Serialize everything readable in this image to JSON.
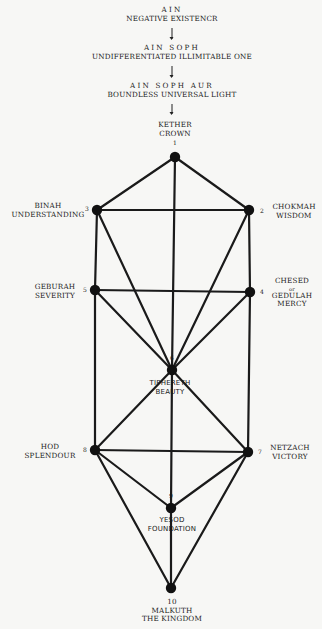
{
  "veils": [
    {
      "title": "AIN",
      "subtitle": "NEGATIVE EXISTENCR"
    },
    {
      "title": "AIN SOPH",
      "subtitle": "UNDIFFERENTIATED ILLIMITABLE ONE"
    },
    {
      "title": "AIN SOPH AUR",
      "subtitle": "BOUNDLESS UNIVERSAL LIGHT"
    }
  ],
  "sephiroth": [
    {
      "number": "1",
      "name": "KETHER",
      "meaning": "CROWN",
      "x": 175,
      "y": 157
    },
    {
      "number": "2",
      "name": "CHOKMAH",
      "meaning": "WISDOM",
      "x": 249,
      "y": 210
    },
    {
      "number": "3",
      "name": "BINAH",
      "meaning": "UNDERSTANDING",
      "x": 97,
      "y": 210
    },
    {
      "number": "4",
      "name": "CHESED",
      "connector": "or",
      "alt_name": "GEDULAH",
      "meaning": "MERCY",
      "x": 250,
      "y": 292
    },
    {
      "number": "5",
      "name": "GEBURAH",
      "meaning": "SEVERITY",
      "x": 95,
      "y": 290
    },
    {
      "number": "6",
      "name": "TIPHERETH",
      "meaning": "BEAUTY",
      "x": 172,
      "y": 370
    },
    {
      "number": "7",
      "name": "NETZACH",
      "meaning": "VICTORY",
      "x": 248,
      "y": 452
    },
    {
      "number": "8",
      "name": "HOD",
      "meaning": "SPLENDOUR",
      "x": 95,
      "y": 450
    },
    {
      "number": "9",
      "name": "YESOD",
      "meaning": "FOUNDATION",
      "x": 171,
      "y": 508
    },
    {
      "number": "10",
      "name": "MALKUTH",
      "meaning": "THE KINGDOM",
      "x": 171,
      "y": 588
    }
  ],
  "paths": [
    [
      1,
      2
    ],
    [
      1,
      3
    ],
    [
      1,
      6
    ],
    [
      2,
      3
    ],
    [
      2,
      4
    ],
    [
      2,
      6
    ],
    [
      3,
      5
    ],
    [
      3,
      6
    ],
    [
      4,
      5
    ],
    [
      4,
      6
    ],
    [
      4,
      7
    ],
    [
      5,
      6
    ],
    [
      5,
      8
    ],
    [
      6,
      7
    ],
    [
      6,
      8
    ],
    [
      6,
      9
    ],
    [
      7,
      8
    ],
    [
      7,
      9
    ],
    [
      7,
      10
    ],
    [
      8,
      9
    ],
    [
      8,
      10
    ],
    [
      9,
      10
    ]
  ],
  "colors": {
    "line": "#1a1a1a",
    "node": "#111111",
    "background": "#f7f7f5"
  }
}
